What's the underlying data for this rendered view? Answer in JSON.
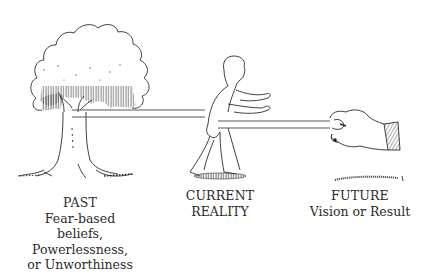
{
  "illustration": {
    "description": "Tree tied by a band that wraps around a man, with a hand pulling the band's other end",
    "ink_color": "#2b2b2b",
    "background": "#ffffff"
  },
  "captions": {
    "past": {
      "title": "PAST",
      "lines": [
        "Fear-based beliefs,",
        "Powerlessness,",
        "or Unworthiness"
      ]
    },
    "current": {
      "title": "CURRENT",
      "lines": [
        "REALITY"
      ]
    },
    "future": {
      "title": "FUTURE",
      "lines": [
        "Vision or Result"
      ]
    }
  }
}
